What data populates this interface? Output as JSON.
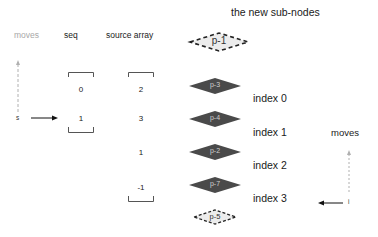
{
  "title": "the new sub-nodes",
  "left": {
    "moves_label": "moves",
    "seq_label": "seq",
    "source_label": "source array",
    "s_label": "s",
    "seq_values": [
      "0",
      "1"
    ],
    "source_values": [
      "2",
      "3",
      "1",
      "-1"
    ]
  },
  "nodes": [
    {
      "label": "p-1",
      "style": "dashed"
    },
    {
      "label": "p-3",
      "style": "solid"
    },
    {
      "label": "p-4",
      "style": "solid"
    },
    {
      "label": "p-2",
      "style": "solid"
    },
    {
      "label": "p-7",
      "style": "solid"
    },
    {
      "label": "p-5",
      "style": "dashed"
    }
  ],
  "indices": [
    "index 0",
    "index 1",
    "index 2",
    "index 3"
  ],
  "right": {
    "moves_label": "moves",
    "i_label": "i"
  },
  "colors": {
    "solid_node": "#4a4a4a",
    "dashed_node_fill": "#e6e6e6",
    "muted_text": "#a8a8a8"
  }
}
